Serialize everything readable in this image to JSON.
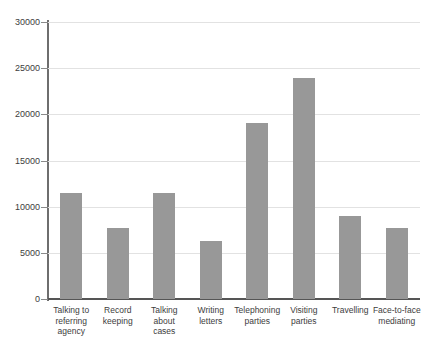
{
  "chart_data": {
    "type": "bar",
    "title": "",
    "xlabel": "",
    "ylabel": "",
    "ylim": [
      0,
      30000
    ],
    "yticks": [
      0,
      5000,
      10000,
      15000,
      20000,
      25000,
      30000
    ],
    "ytick_labels": [
      "0",
      "5000",
      "10000",
      "15000",
      "20000",
      "25000",
      "30000"
    ],
    "grid": true,
    "legend": "none",
    "bar_color": "#989898",
    "categories": [
      "Talking to referring agency",
      "Record keeping",
      "Talking about cases",
      "Writing letters",
      "Telephoning parties",
      "Visiting parties",
      "Travelling",
      "Face-to-face mediating"
    ],
    "category_lines": [
      [
        "Talking to",
        "referring",
        "agency"
      ],
      [
        "Record",
        "keeping"
      ],
      [
        "Talking",
        "about",
        "cases"
      ],
      [
        "Writing",
        "letters"
      ],
      [
        "Telephoning",
        "parties"
      ],
      [
        "Visiting",
        "parties"
      ],
      [
        "Travelling"
      ],
      [
        "Face-to-face",
        "mediating"
      ]
    ],
    "values": [
      11500,
      7700,
      11500,
      6300,
      19100,
      23900,
      9000,
      7700
    ]
  }
}
